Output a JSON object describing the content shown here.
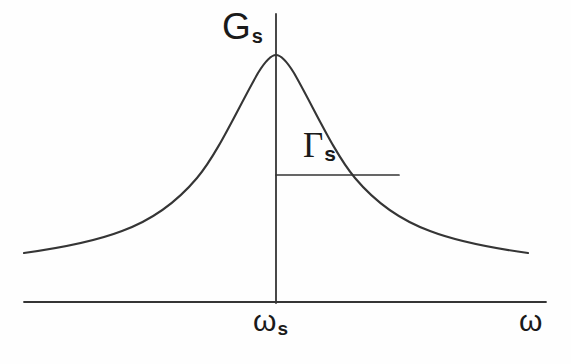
{
  "figure": {
    "kind": "line-plot",
    "background_color": "#fefefe",
    "ink_color": "#353535"
  },
  "labels": {
    "peak_amplitude": {
      "symbol": "G",
      "subscript": "s"
    },
    "linewidth": {
      "symbol": "Γ",
      "subscript": "s"
    },
    "center_frequency": {
      "symbol": "ω",
      "subscript": "s"
    },
    "x_axis": {
      "symbol": "ω",
      "subscript": ""
    }
  },
  "chart_data": {
    "type": "line",
    "title": "",
    "xlabel": "ω",
    "ylabel": "",
    "grid": false,
    "legend": null,
    "curve_name": "spectral lineshape",
    "peak": {
      "x": 0.0,
      "y": 1.0,
      "label": "G_s",
      "x_tick_label": "ω_s"
    },
    "halfwidth_marker": {
      "label": "Γ_s",
      "level": 0.5,
      "from_x": 0.0,
      "to_x": 1.0,
      "description": "half width at half maximum, drawn from peak axis to right flank"
    },
    "xlim": [
      -3.45,
      3.45
    ],
    "ylim": [
      0,
      1.16
    ],
    "x": [
      -3.45,
      -3.2,
      -2.95,
      -2.7,
      -2.45,
      -2.2,
      -1.95,
      -1.7,
      -1.45,
      -1.2,
      -0.95,
      -0.7,
      -0.45,
      -0.2,
      0.0,
      0.2,
      0.45,
      0.7,
      0.95,
      1.2,
      1.45,
      1.7,
      1.95,
      2.2,
      2.45,
      2.7,
      2.95,
      3.2,
      3.45
    ],
    "y": [
      0.077,
      0.089,
      0.103,
      0.121,
      0.143,
      0.171,
      0.208,
      0.257,
      0.322,
      0.41,
      0.526,
      0.671,
      0.831,
      0.962,
      1.0,
      0.962,
      0.831,
      0.671,
      0.526,
      0.41,
      0.322,
      0.257,
      0.208,
      0.171,
      0.143,
      0.121,
      0.103,
      0.089,
      0.077
    ],
    "formula": "G_s / (1 + (x/Γ_s)^2)"
  },
  "geometry": {
    "x_axis": {
      "x1": 24,
      "y1": 302,
      "x2": 546,
      "y2": 302
    },
    "center_axis": {
      "x1": 276,
      "y1": 14,
      "x2": 276,
      "y2": 303
    },
    "halfwidth_line": {
      "x1": 276,
      "y1": 175,
      "x2": 399,
      "y2": 175
    },
    "curve_points": "M 24 253 C 60 248 96 241 122 231 C 152 220 176 203 197 178 C 218 153 238 108 258 73 C 266 60 271 55 276 55 C 281 55 286 60 294 73 C 314 108 334 153 355 178 C 376 203 400 220 430 231 C 456 241 492 248 528 253"
  }
}
